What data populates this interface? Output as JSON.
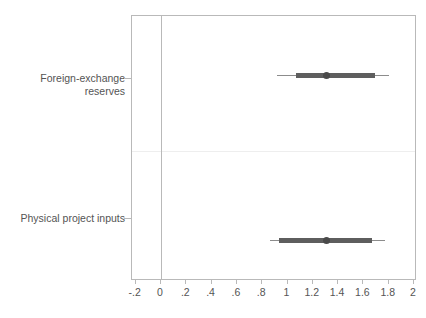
{
  "chart_data": {
    "type": "scatter",
    "subtype": "coefficient-plot-with-confidence-intervals",
    "title": "",
    "subtitle": "",
    "xlabel": "",
    "ylabel": "",
    "xlim": [
      -0.3,
      2.05
    ],
    "grid": false,
    "legend": null,
    "zero_reference_line": 0,
    "xticks": [
      -0.2,
      0,
      0.2,
      0.4,
      0.6,
      0.8,
      1,
      1.2,
      1.4,
      1.6,
      1.8,
      2
    ],
    "xticklabels": [
      "-.2",
      "0",
      ".2",
      ".4",
      ".6",
      ".8",
      "1",
      "1.2",
      "1.4",
      "1.6",
      "1.8",
      "2"
    ],
    "categories": [
      "Foreign-exchange\nreserves",
      "Physical project inputs"
    ],
    "series": [
      {
        "name": "Point estimate with 90% and 95% confidence intervals",
        "points": [
          {
            "category": "Foreign-exchange reserves",
            "estimate": 1.31,
            "inner_low": 1.07,
            "inner_high": 1.69,
            "outer_low": 0.92,
            "outer_high": 1.8
          },
          {
            "category": "Physical project inputs",
            "estimate": 1.31,
            "inner_low": 0.93,
            "inner_high": 1.67,
            "outer_low": 0.86,
            "outer_high": 1.77
          }
        ]
      }
    ],
    "colors": {
      "point_marker": "#4a4a4a",
      "inner_interval": "#5e5e5e",
      "outer_interval": "#8c8c8c",
      "axis": "#b9b9b9",
      "panel_divider": "#eeeeee",
      "text": "#545454",
      "background": "#ffffff"
    }
  },
  "axis": {
    "x_tick_labels": [
      "-.2",
      "0",
      ".2",
      ".4",
      ".6",
      ".8",
      "1",
      "1.2",
      "1.4",
      "1.6",
      "1.8",
      "2"
    ],
    "y_tick_labels": [
      "Foreign-exchange\nreserves",
      "Physical project inputs"
    ]
  }
}
